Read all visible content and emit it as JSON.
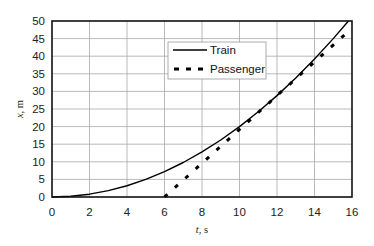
{
  "chart_data": {
    "type": "line",
    "title": "",
    "xlabel": "t, s",
    "ylabel": "x, m",
    "xlim": [
      0,
      16
    ],
    "ylim": [
      0,
      50
    ],
    "xticks": [
      0,
      2,
      4,
      6,
      8,
      10,
      12,
      14,
      16
    ],
    "yticks": [
      0,
      5,
      10,
      15,
      20,
      25,
      30,
      35,
      40,
      45,
      50
    ],
    "grid": true,
    "legend_position": "upper-center",
    "series": [
      {
        "name": "Train",
        "style": "solid",
        "color": "#000000",
        "x": [
          0,
          1,
          2,
          3,
          4,
          5,
          6,
          7,
          8,
          9,
          10,
          11,
          12,
          13,
          14,
          15,
          15.81
        ],
        "y": [
          0,
          0.2,
          0.8,
          1.8,
          3.2,
          5.0,
          7.2,
          9.8,
          12.8,
          16.2,
          20.0,
          24.2,
          28.8,
          33.8,
          39.2,
          45.0,
          50.0
        ]
      },
      {
        "name": "Passenger",
        "style": "dashed",
        "color": "#000000",
        "x": [
          6,
          8,
          10,
          12,
          14,
          15.8
        ],
        "y": [
          0,
          9.6,
          19.2,
          28.8,
          38.4,
          47.0
        ]
      }
    ]
  },
  "legend": {
    "items": [
      {
        "label": "Train",
        "style": "solid"
      },
      {
        "label": "Passenger",
        "style": "dashed"
      }
    ]
  },
  "axes": {
    "xlabel_italic": "t",
    "xlabel_unit": ", s",
    "ylabel_italic": "x",
    "ylabel_unit": ", m"
  }
}
